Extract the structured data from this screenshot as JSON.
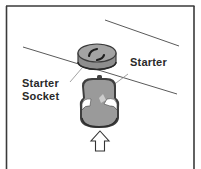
{
  "figure": {
    "labels": {
      "starter": "Starter",
      "socket_line1": "Starter",
      "socket_line2": "Socket"
    },
    "colors": {
      "frame": "#3a3a3a",
      "line": "#555555",
      "body_fill": "#9a9a9a",
      "body_dark": "#3c3c3c",
      "highlight": "#ffffff",
      "label": "#2a2a2a"
    },
    "elements": [
      {
        "id": "starter-socket",
        "shape": "disc",
        "label": "Starter Socket"
      },
      {
        "id": "starter",
        "shape": "cylindrical-can",
        "label": "Starter"
      },
      {
        "id": "insert-arrow",
        "shape": "outline-arrow-up",
        "meaning": "push starter upward into socket"
      }
    ]
  }
}
